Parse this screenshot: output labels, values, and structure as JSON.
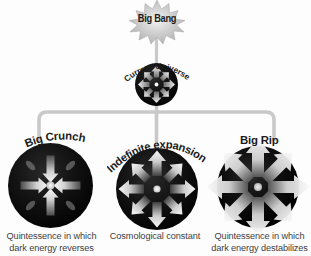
{
  "diagram": {
    "background_color": "#fdfdfd",
    "connector_color": "#c9c9c9",
    "sphere_color": "#070707",
    "arrow_color": "#d9d9d9",
    "text_color": "#1c1c1c",
    "caption_color": "#3d3d3d"
  },
  "root": {
    "label": "Big Bang",
    "icon": "starburst-icon"
  },
  "current": {
    "label": "Current Universe",
    "icon": "sphere-radiating-arrows-icon"
  },
  "branches": [
    {
      "id": "big-crunch",
      "label": "Big Crunch",
      "icon": "sphere-inward-arrows-icon",
      "arrow_direction": "inward",
      "caption_line1": "Quintessence in which",
      "caption_line2": "dark energy reverses"
    },
    {
      "id": "indefinite-expansion",
      "label": "Indefinite expansion",
      "icon": "sphere-outward-arrows-icon",
      "arrow_direction": "outward",
      "caption_line1": "Cosmological constant",
      "caption_line2": ""
    },
    {
      "id": "big-rip",
      "label": "Big Rip",
      "icon": "sphere-bursting-arrows-icon",
      "arrow_direction": "bursting",
      "caption_line1": "Quintessence in which",
      "caption_line2": "dark energy destabilizes"
    }
  ]
}
